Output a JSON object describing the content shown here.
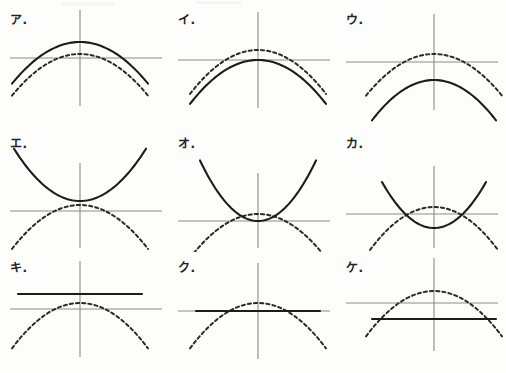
{
  "page": {
    "background_color": "#fdfdfc",
    "axis_color": "#8c8c8c",
    "solid_curve_color": "#1c1c1c",
    "dashed_curve_color": "#2a2a2a",
    "grid": {
      "columns": 3,
      "rows": 3,
      "panel_width": 168,
      "panel_height": 124
    }
  },
  "chart_data": {
    "type": "line",
    "xlabel": "",
    "ylabel": "",
    "grid": false,
    "legend_position": "none",
    "panels": [
      {
        "label": "ア.",
        "row": 0,
        "column": 0,
        "origin": {
          "x": 78,
          "y": 54
        },
        "axes": {
          "x_axis_y": 54,
          "y_axis_x": 78
        },
        "series": [
          {
            "name": "solid",
            "style": "solid",
            "shape": "parabola",
            "direction": "down",
            "vertex": {
              "x": 0,
              "y": 16
            },
            "width": "wide",
            "a": -0.009,
            "x_range": [
              -68,
              68
            ]
          },
          {
            "name": "dashed",
            "style": "dashed",
            "shape": "parabola",
            "direction": "down",
            "vertex": {
              "x": 0,
              "y": 4
            },
            "width": "wide",
            "a": -0.009,
            "x_range": [
              -68,
              68
            ]
          }
        ],
        "description": "Solid downward parabola sits above the dashed reference parabola; both peak above the x-axis."
      },
      {
        "label": "イ.",
        "row": 0,
        "column": 1,
        "origin": {
          "x": 88,
          "y": 56
        },
        "axes": {
          "x_axis_y": 56,
          "y_axis_x": 88
        },
        "series": [
          {
            "name": "solid",
            "style": "solid",
            "shape": "parabola",
            "direction": "down",
            "vertex": {
              "x": 0,
              "y": 0
            },
            "width": "wide",
            "a": -0.0095,
            "x_range": [
              -68,
              68
            ]
          },
          {
            "name": "dashed",
            "style": "dashed",
            "shape": "parabola",
            "direction": "down",
            "vertex": {
              "x": 0,
              "y": 10
            },
            "width": "wide",
            "a": -0.0095,
            "x_range": [
              -68,
              68
            ]
          }
        ],
        "description": "Solid downward parabola has its vertex at the origin, below the dashed reference."
      },
      {
        "label": "ウ.",
        "row": 0,
        "column": 2,
        "origin": {
          "x": 96,
          "y": 58
        },
        "axes": {
          "x_axis_y": 58,
          "y_axis_x": 96
        },
        "series": [
          {
            "name": "solid",
            "style": "solid",
            "shape": "parabola",
            "direction": "down",
            "vertex": {
              "x": 0,
              "y": -18
            },
            "width": "wide",
            "a": -0.0105,
            "x_range": [
              -62,
              62
            ]
          },
          {
            "name": "dashed",
            "style": "dashed",
            "shape": "parabola",
            "direction": "down",
            "vertex": {
              "x": 0,
              "y": 8
            },
            "width": "wide",
            "a": -0.009,
            "x_range": [
              -68,
              68
            ]
          }
        ],
        "description": "Solid downward parabola translated below the x-axis, clearly under the dashed reference."
      },
      {
        "label": "エ.",
        "row": 1,
        "column": 0,
        "origin": {
          "x": 78,
          "y": 83
        },
        "axes": {
          "x_axis_y": 83,
          "y_axis_x": 78
        },
        "series": [
          {
            "name": "solid",
            "style": "solid",
            "shape": "parabola",
            "direction": "up",
            "vertex": {
              "x": 0,
              "y": 10
            },
            "width": "wide",
            "a": 0.012,
            "x_range": [
              -66,
              66
            ]
          },
          {
            "name": "dashed",
            "style": "dashed",
            "shape": "parabola",
            "direction": "down",
            "vertex": {
              "x": 0,
              "y": 6
            },
            "width": "wide",
            "a": -0.0095,
            "x_range": [
              -68,
              68
            ]
          }
        ],
        "description": "Solid upward parabola with vertex above the x-axis, opening opposite to the dashed reference."
      },
      {
        "label": "オ.",
        "row": 1,
        "column": 1,
        "origin": {
          "x": 88,
          "y": 93
        },
        "axes": {
          "x_axis_y": 93,
          "y_axis_x": 88
        },
        "series": [
          {
            "name": "solid",
            "style": "solid",
            "shape": "parabola",
            "direction": "up",
            "vertex": {
              "x": 0,
              "y": 0
            },
            "width": "narrow",
            "a": 0.018,
            "x_range": [
              -58,
              58
            ]
          },
          {
            "name": "dashed",
            "style": "dashed",
            "shape": "parabola",
            "direction": "down",
            "vertex": {
              "x": 0,
              "y": 7
            },
            "width": "wide",
            "a": -0.0095,
            "x_range": [
              -68,
              68
            ]
          }
        ],
        "description": "Solid upward parabola with vertex at the origin, touching the x-axis."
      },
      {
        "label": "カ.",
        "row": 1,
        "column": 2,
        "origin": {
          "x": 96,
          "y": 86
        },
        "axes": {
          "x_axis_y": 86,
          "y_axis_x": 96
        },
        "series": [
          {
            "name": "solid",
            "style": "solid",
            "shape": "parabola",
            "direction": "up",
            "vertex": {
              "x": 0,
              "y": -14
            },
            "width": "narrow",
            "a": 0.017,
            "x_range": [
              -52,
              52
            ]
          },
          {
            "name": "dashed",
            "style": "dashed",
            "shape": "parabola",
            "direction": "down",
            "vertex": {
              "x": 0,
              "y": 7
            },
            "width": "wide",
            "a": -0.0105,
            "x_range": [
              -64,
              64
            ]
          }
        ],
        "description": "Solid upward parabola dips below the x-axis and crosses the dashed reference twice."
      },
      {
        "label": "キ.",
        "row": 2,
        "column": 0,
        "origin": {
          "x": 78,
          "y": 57
        },
        "axes": {
          "x_axis_y": 57,
          "y_axis_x": 78
        },
        "series": [
          {
            "name": "solid",
            "style": "solid",
            "shape": "horizontal-line",
            "y": 15,
            "x_range": [
              -62,
              62
            ]
          },
          {
            "name": "dashed",
            "style": "dashed",
            "shape": "parabola",
            "direction": "down",
            "vertex": {
              "x": 0,
              "y": 6
            },
            "width": "wide",
            "a": -0.0098,
            "x_range": [
              -68,
              68
            ]
          }
        ],
        "description": "Solid horizontal line drawn above the x-axis, above the dashed parabola peak."
      },
      {
        "label": "ク.",
        "row": 2,
        "column": 1,
        "origin": {
          "x": 88,
          "y": 59
        },
        "axes": {
          "x_axis_y": 59,
          "y_axis_x": 88
        },
        "series": [
          {
            "name": "solid",
            "style": "solid",
            "shape": "horizontal-line",
            "y": 0,
            "x_range": [
              -62,
              62
            ]
          },
          {
            "name": "dashed",
            "style": "dashed",
            "shape": "parabola",
            "direction": "down",
            "vertex": {
              "x": 0,
              "y": 8
            },
            "width": "wide",
            "a": -0.0098,
            "x_range": [
              -68,
              68
            ]
          }
        ],
        "description": "Solid horizontal line lying exactly on the x-axis, cutting the dashed parabola at two points."
      },
      {
        "label": "ケ.",
        "row": 2,
        "column": 2,
        "origin": {
          "x": 96,
          "y": 51
        },
        "axes": {
          "x_axis_y": 51,
          "y_axis_x": 96
        },
        "series": [
          {
            "name": "solid",
            "style": "solid",
            "shape": "horizontal-line",
            "y": -16,
            "x_range": [
              -62,
              62
            ]
          },
          {
            "name": "dashed",
            "style": "dashed",
            "shape": "parabola",
            "direction": "down",
            "vertex": {
              "x": 0,
              "y": 12
            },
            "width": "wide",
            "a": -0.0098,
            "x_range": [
              -68,
              68
            ]
          }
        ],
        "description": "Solid horizontal line drawn below the x-axis, intersecting the dashed parabola near its ends."
      }
    ]
  }
}
